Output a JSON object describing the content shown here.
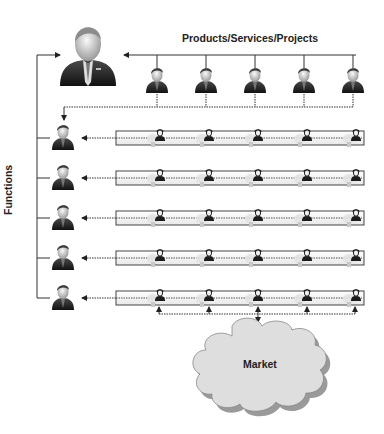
{
  "diagram": {
    "type": "matrix-organization",
    "header_label": "Products/Services/Projects",
    "side_label": "Functions",
    "market_label": "Market",
    "executive": {
      "icon": "executive-icon"
    },
    "product_managers": [
      {
        "id": "pm-1",
        "icon": "manager-icon"
      },
      {
        "id": "pm-2",
        "icon": "manager-icon"
      },
      {
        "id": "pm-3",
        "icon": "manager-icon"
      },
      {
        "id": "pm-4",
        "icon": "manager-icon"
      },
      {
        "id": "pm-5",
        "icon": "manager-icon"
      }
    ],
    "functional_managers": [
      {
        "id": "fm-1",
        "icon": "manager-icon"
      },
      {
        "id": "fm-2",
        "icon": "manager-icon"
      },
      {
        "id": "fm-3",
        "icon": "manager-icon"
      },
      {
        "id": "fm-4",
        "icon": "manager-icon"
      },
      {
        "id": "fm-5",
        "icon": "manager-icon"
      }
    ],
    "team_members_per_row": 5,
    "colors": {
      "line": "#333333",
      "bar_fill": "#f4f4f4",
      "bar_stroke": "#444444",
      "cloud_fill": "#dedede",
      "cloud_shadow": "#9a9a9a",
      "text": "#222222"
    }
  }
}
